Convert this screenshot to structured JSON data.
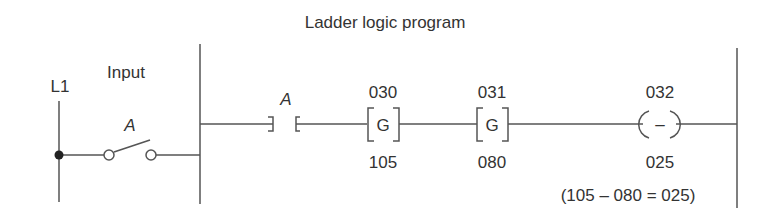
{
  "title": "Ladder logic program",
  "input_section": {
    "rail_label": "L1",
    "input_label": "Input",
    "switch_label": "A"
  },
  "rung": {
    "contact": {
      "label": "A",
      "type": "normally-open-contact"
    },
    "instructions": [
      {
        "type": "greater-than",
        "symbol": "G",
        "top": "030",
        "bottom": "105"
      },
      {
        "type": "greater-than",
        "symbol": "G",
        "top": "031",
        "bottom": "080"
      }
    ],
    "output": {
      "type": "subtract-coil",
      "symbol": "–",
      "top": "032",
      "bottom": "025"
    },
    "equation": "(105 – 080 = 025)"
  },
  "colors": {
    "line": "#555555",
    "text": "#333333"
  }
}
